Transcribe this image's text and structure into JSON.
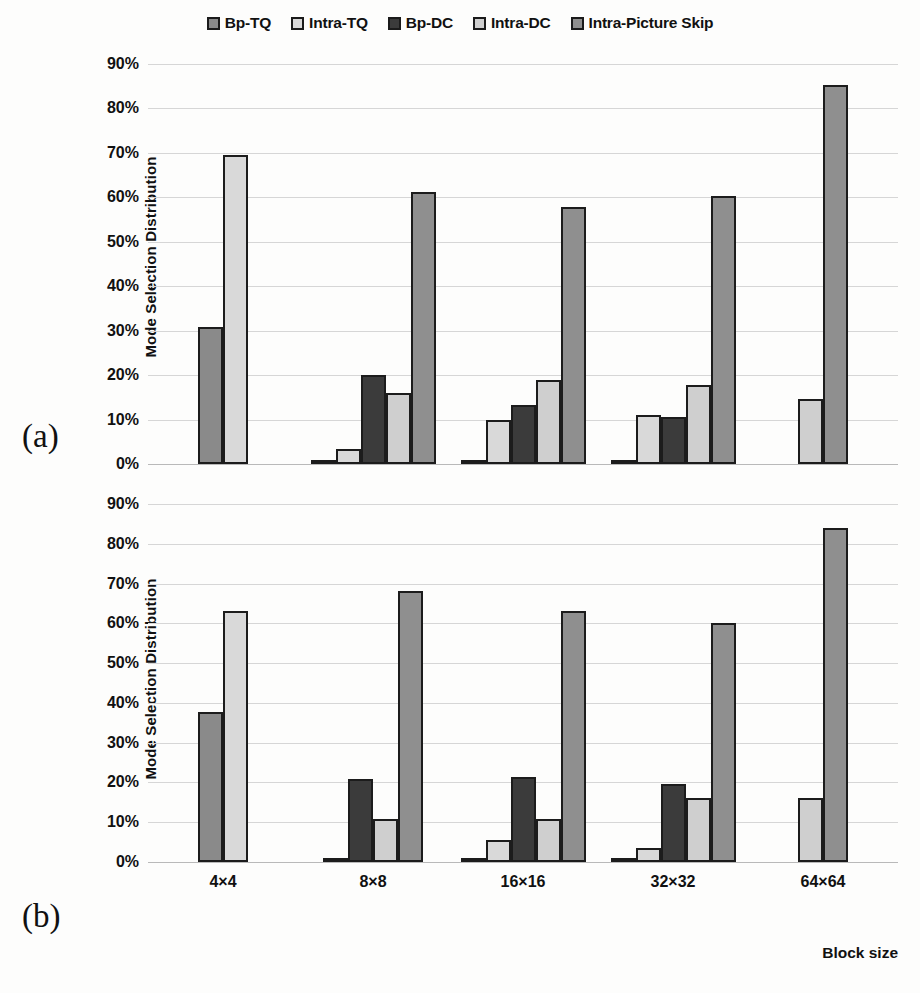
{
  "legend": {
    "items": [
      {
        "label": "Bp-TQ",
        "icon": "square-swatch-icon",
        "color": "#8a8a8a"
      },
      {
        "label": "Intra-TQ",
        "icon": "square-swatch-icon",
        "color": "#d9d9d9"
      },
      {
        "label": "Bp-DC",
        "icon": "square-swatch-icon",
        "color": "#3b3b3b"
      },
      {
        "label": "Intra-DC",
        "icon": "square-swatch-icon",
        "color": "#cfcfcf"
      },
      {
        "label": "Intra-Picture Skip",
        "icon": "square-swatch-icon",
        "color": "#8f8f8f"
      }
    ]
  },
  "panels": {
    "a": {
      "marker": "(a)"
    },
    "b": {
      "marker": "(b)"
    }
  },
  "axis": {
    "ylabel": "Mode Selection Distribution",
    "xlabel": "Block size",
    "yticks": [
      "0%",
      "10%",
      "20%",
      "30%",
      "40%",
      "50%",
      "60%",
      "70%",
      "80%",
      "90%"
    ],
    "xticks": [
      "4×4",
      "8×8",
      "16×16",
      "32×32",
      "64×64"
    ]
  },
  "chart_data": [
    {
      "type": "bar",
      "panel": "(a)",
      "title": "",
      "xlabel": "Block size",
      "ylabel": "Mode Selection Distribution",
      "ylim": [
        0,
        90
      ],
      "ytick_step": 10,
      "grid": true,
      "legend_position": "top",
      "categories": [
        "4×4",
        "8×8",
        "16×16",
        "32×32",
        "64×64"
      ],
      "series": [
        {
          "name": "Bp-TQ",
          "color": "#8a8a8a",
          "values": [
            30.9,
            0.7,
            0.7,
            0.5,
            0
          ]
        },
        {
          "name": "Intra-TQ",
          "color": "#d9d9d9",
          "values": [
            69.5,
            3.3,
            9.8,
            11.0,
            0
          ]
        },
        {
          "name": "Bp-DC",
          "color": "#3b3b3b",
          "values": [
            0,
            20.1,
            13.2,
            10.5,
            0
          ]
        },
        {
          "name": "Intra-DC",
          "color": "#cfcfcf",
          "values": [
            0,
            15.9,
            18.9,
            17.8,
            14.6
          ]
        },
        {
          "name": "Intra-Picture Skip",
          "color": "#8f8f8f",
          "values": [
            0,
            61.1,
            57.8,
            60.4,
            85.3
          ]
        }
      ]
    },
    {
      "type": "bar",
      "panel": "(b)",
      "title": "",
      "xlabel": "Block size",
      "ylabel": "Mode Selection Distribution",
      "ylim": [
        0,
        90
      ],
      "ytick_step": 10,
      "grid": true,
      "legend_position": "top",
      "categories": [
        "4×4",
        "8×8",
        "16×16",
        "32×32",
        "64×64"
      ],
      "series": [
        {
          "name": "Bp-TQ",
          "color": "#8a8a8a",
          "values": [
            37.7,
            0.6,
            0.6,
            0.5,
            0
          ]
        },
        {
          "name": "Intra-TQ",
          "color": "#d9d9d9",
          "values": [
            63.0,
            0,
            5.6,
            3.5,
            0
          ]
        },
        {
          "name": "Bp-DC",
          "color": "#3b3b3b",
          "values": [
            0,
            20.9,
            21.3,
            19.7,
            0
          ]
        },
        {
          "name": "Intra-DC",
          "color": "#cfcfcf",
          "values": [
            0,
            10.8,
            10.7,
            16.0,
            16.0
          ]
        },
        {
          "name": "Intra-Picture Skip",
          "color": "#8f8f8f",
          "values": [
            0,
            68.2,
            63.2,
            60.0,
            83.9
          ]
        }
      ]
    }
  ]
}
